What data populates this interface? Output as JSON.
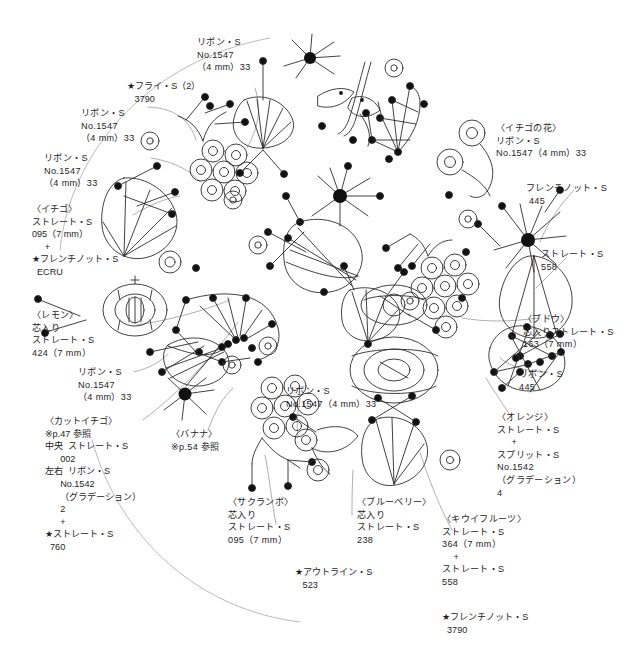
{
  "meta": {
    "ink_color": "#1d1d1d",
    "line_color": "#2b2b2b",
    "leader_color": "#8f8f8f",
    "background": "#ffffff",
    "width": 624,
    "height": 652
  },
  "labels": {
    "ribbon_top_center": "リボン・S\nNo.1547\n（4 mm）33",
    "fly_stitch": "★フライ・S（2）\n   3790",
    "ribbon_upper_left": "リボン・S\nNo.1547\n（4 mm）33",
    "ribbon_left_second": "リボン・S\nNo.1547\n（4 mm）33",
    "ichigo": "〈イチゴ〉\nストレート・S\n095（7 mm）\n     +\n★フレンチノット・S\n  ECRU",
    "lemon": "〈レモン〉\n芯入り\nストレート・S\n424（7 mm）",
    "ribbon_mid_left": "リボン・S\nNo.1547\n（4 mm）33",
    "cut_ichigo": "〈カットイチゴ〉\n※p.47 参照\n中央  ストレート・S\n      002\n左右  リボン・S\n      No.1542\n      （グラデーション）\n      2\n      +\n★ストレート・S\n  760",
    "banana": "〈バナナ〉\n※p.54 参照",
    "ribbon_center": "リボン・S\nNo.1547（4 mm）33",
    "sakuranbo": "〈サクランボ〉\n芯入り\nストレート・S\n095（7 mm）",
    "outline_stitch": "★アウトライン・S\n   523",
    "blueberry": "〈ブルーベリー〉\n芯入り\nストレート・S\n238",
    "ichigo_flower": "〈イチゴの花〉\nリボン・S\nNo.1547（4 mm）33",
    "french_knot_445": "フレンチノット・S\n 445",
    "straight_558": "ストレート・S\n558",
    "budou": "〈ブドウ〉\n芯入りストレート・S\n163（7 mm）",
    "ribbon_445": "リボン・S\n445",
    "orange": "〈オレンジ〉\nストレート・S\n     +\nスプリット・S\nNo.1542\n（グラデーション）\n4",
    "kiwi": "〈キウイフルーツ〉\nストレート・S\n364（7 mm）\n    +\nストレート・S\n558",
    "french_knot_3790": "★フレンチノット・S\n  3790"
  }
}
